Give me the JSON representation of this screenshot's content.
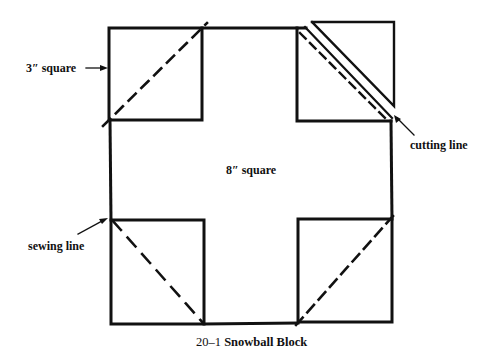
{
  "figure": {
    "number": "20–1",
    "title": "Snowball Block"
  },
  "labels": {
    "big_square": "8″ square",
    "small_square": "3″ square",
    "cutting_line": "cutting line",
    "sewing_line": "sewing line"
  },
  "colors": {
    "line": "#111111",
    "background": "#ffffff"
  },
  "diagram": {
    "big_square_size_in": 8,
    "corner_square_size_in": 3,
    "corner_squares": [
      {
        "position": "top-left",
        "diagonal": "sewing",
        "direction": "bottom-left-to-top-right"
      },
      {
        "position": "top-right",
        "diagonal": "sewing+cutting",
        "direction": "top-left-to-bottom-right",
        "trimmed_triangle": true
      },
      {
        "position": "bottom-left",
        "diagonal": "sewing",
        "direction": "top-left-to-bottom-right"
      },
      {
        "position": "bottom-right",
        "diagonal": "sewing",
        "direction": "bottom-left-to-top-right"
      }
    ]
  }
}
